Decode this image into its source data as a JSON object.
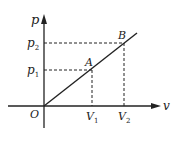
{
  "diagram": {
    "type": "p-V graph",
    "axes": {
      "y_label": "p",
      "x_label": "v",
      "origin_label": "O"
    },
    "points": [
      {
        "name": "A",
        "label": "A",
        "p_label": "p",
        "p_sub": "1",
        "v_label": "V",
        "v_sub": "1"
      },
      {
        "name": "B",
        "label": "B",
        "p_label": "p",
        "p_sub": "2",
        "v_label": "V",
        "v_sub": "2"
      }
    ],
    "line": "straight line through origin O, A and B",
    "colors": {
      "stroke": "#222222",
      "background": "#ffffff"
    }
  }
}
